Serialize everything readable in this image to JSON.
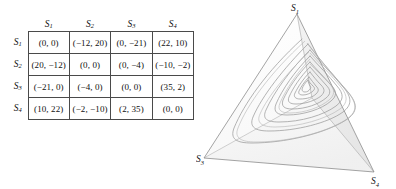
{
  "figure": {
    "matrix": {
      "name": "payoff-matrix",
      "column_headers": [
        "S1",
        "S2",
        "S3",
        "S4"
      ],
      "row_headers": [
        "S1",
        "S2",
        "S3",
        "S4"
      ],
      "header_base": "S",
      "header_subscripts": [
        "1",
        "2",
        "3",
        "4"
      ],
      "rows": [
        [
          "(0, 0)",
          "(−12, 20)",
          "(0, −21)",
          "(22, 10)"
        ],
        [
          "(20, −12)",
          "(0, 0)",
          "(0, −4)",
          "(−10, −2)"
        ],
        [
          "(−21, 0)",
          "(−4, 0)",
          "(0, 0)",
          "(35, 2)"
        ],
        [
          "(10, 22)",
          "(−2, −10)",
          "(2, 35)",
          "(0, 0)"
        ]
      ]
    },
    "simplex": {
      "name": "simplex-tetrahedron",
      "vertices": [
        {
          "id": "v-top",
          "base": "S",
          "sub": "1",
          "x": 101,
          "y": 14,
          "label_x": 96,
          "label_y": 12
        },
        {
          "id": "v-back-hidden",
          "base": "S",
          "sub": "2",
          "x": 116,
          "y": 98,
          "label_x": 0,
          "label_y": 0
        },
        {
          "id": "v-bottom-left",
          "base": "S",
          "sub": "3",
          "x": 8,
          "y": 158,
          "label_x": 1,
          "label_y": 160
        },
        {
          "id": "v-bottom-right",
          "base": "S",
          "sub": "4",
          "x": 178,
          "y": 172,
          "label_x": 178,
          "label_y": 183
        }
      ],
      "colors": {
        "edge": "#8d8d8d",
        "hidden_edge": "#b9b9b9",
        "face_front": "#fbfbfb",
        "face_right": "#ededed",
        "face_bottom": "#f4f4f4",
        "trajectory": "#9a9a9a"
      },
      "trajectory": {
        "type": "spiral",
        "description": "triangular limit-cycle spiral converging inward",
        "turns": 7,
        "center_x": 104,
        "center_y": 112
      }
    }
  }
}
